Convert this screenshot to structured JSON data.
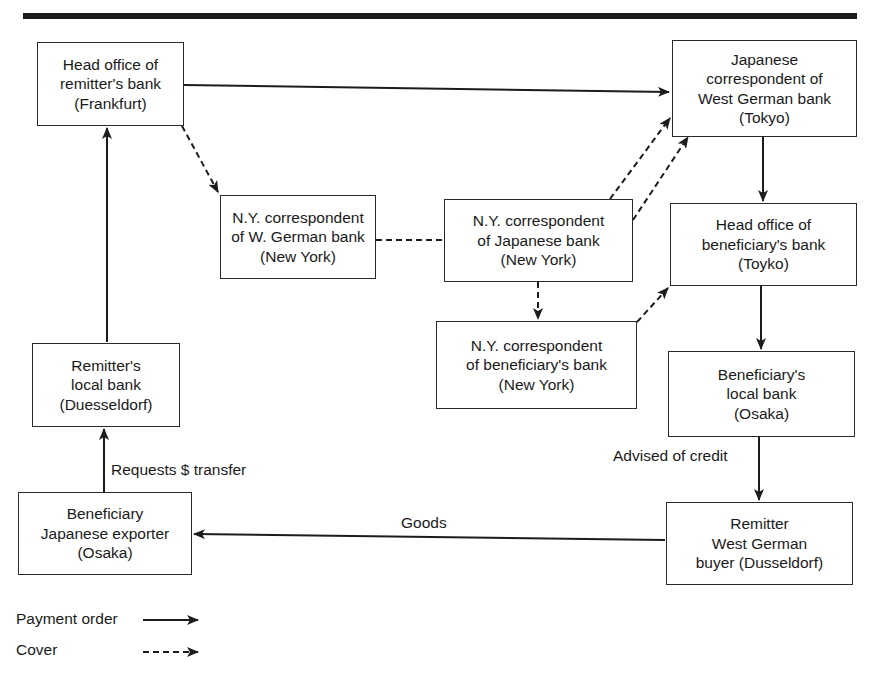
{
  "diagram": {
    "type": "flow",
    "nodes": [
      {
        "id": "frankfurt",
        "lines": [
          "Head office of",
          "remitter's bank",
          "(Frankfurt)"
        ]
      },
      {
        "id": "tokyo_corr",
        "lines": [
          "Japanese",
          "correspondent of",
          "West German bank",
          "(Tokyo)"
        ]
      },
      {
        "id": "ny_wgerman",
        "lines": [
          "N.Y. correspondent",
          "of W. German bank",
          "(New York)"
        ]
      },
      {
        "id": "ny_japanese",
        "lines": [
          "N.Y. correspondent",
          "of Japanese bank",
          "(New York)"
        ]
      },
      {
        "id": "head_beneficiary",
        "lines": [
          "Head office of",
          "beneficiary's bank",
          "(Toyko)"
        ]
      },
      {
        "id": "ny_beneficiary",
        "lines": [
          "N.Y. correspondent",
          "of beneficiary's bank",
          "(New York)"
        ]
      },
      {
        "id": "beneficiary_local",
        "lines": [
          "Beneficiary's",
          "local bank",
          "(Osaka)"
        ]
      },
      {
        "id": "remitter_local",
        "lines": [
          "Remitter's",
          "local bank",
          "(Duesseldorf)"
        ]
      },
      {
        "id": "exporter",
        "lines": [
          "Beneficiary",
          "Japanese exporter",
          "(Osaka)"
        ]
      },
      {
        "id": "buyer",
        "lines": [
          "Remitter",
          "West German",
          "buyer (Dusseldorf)"
        ]
      }
    ],
    "edges": [
      {
        "from": "frankfurt",
        "to": "tokyo_corr",
        "style": "payment_order"
      },
      {
        "from": "frankfurt",
        "to": "ny_wgerman",
        "style": "cover"
      },
      {
        "from": "ny_wgerman",
        "to": "ny_japanese",
        "style": "cover_line"
      },
      {
        "from": "ny_japanese",
        "to": "tokyo_corr",
        "style": "cover"
      },
      {
        "from": "ny_japanese",
        "to": "tokyo_corr",
        "style": "cover"
      },
      {
        "from": "ny_japanese",
        "to": "ny_beneficiary",
        "style": "cover"
      },
      {
        "from": "ny_beneficiary",
        "to": "head_beneficiary",
        "style": "cover"
      },
      {
        "from": "tokyo_corr",
        "to": "head_beneficiary",
        "style": "payment_order"
      },
      {
        "from": "head_beneficiary",
        "to": "beneficiary_local",
        "style": "payment_order"
      },
      {
        "from": "beneficiary_local",
        "to": "buyer",
        "style": "payment_order",
        "label": "Advised of credit"
      },
      {
        "from": "buyer",
        "to": "exporter",
        "style": "payment_order",
        "label": "Goods"
      },
      {
        "from": "exporter",
        "to": "remitter_local",
        "style": "payment_order",
        "label": "Requests $ transfer"
      },
      {
        "from": "remitter_local",
        "to": "frankfurt",
        "style": "payment_order"
      }
    ],
    "edge_labels": {
      "requests_transfer": "Requests $ transfer",
      "goods": "Goods",
      "advised_credit": "Advised of credit"
    },
    "legend": {
      "payment_order": "Payment order",
      "cover": "Cover"
    },
    "colors": {
      "ink": "#1c1c1c",
      "background": "#ffffff"
    }
  }
}
